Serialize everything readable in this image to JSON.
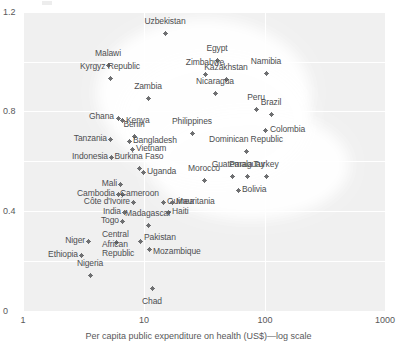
{
  "chart_data": {
    "type": "scatter",
    "title": "",
    "xlabel": "Per capita public expenditure on health (US$)—log scale",
    "ylabel": "",
    "xscale": "log",
    "xlim": [
      1,
      1000
    ],
    "ylim": [
      0,
      1.2
    ],
    "xticks": [
      "1",
      "10",
      "100",
      "1000"
    ],
    "xtick_values": [
      1,
      10,
      100,
      1000
    ],
    "yticks": [
      "0",
      "0.4",
      "0.8",
      "1.2"
    ],
    "ytick_values": [
      0,
      0.4,
      0.8,
      1.2
    ],
    "grid": true,
    "legend": "none",
    "points": [
      {
        "label": "Uzbekistan",
        "x": 15,
        "y": 1.155,
        "px": 165,
        "py": 33,
        "lx": 165,
        "ly": 26,
        "pos": "above"
      },
      {
        "label": "Egypt",
        "x": 45,
        "y": 1.06,
        "px": 217,
        "py": 60,
        "lx": 217,
        "ly": 53,
        "pos": "above"
      },
      {
        "label": "Namibia",
        "x": 100,
        "y": 1.025,
        "px": 266,
        "py": 73,
        "lx": 266,
        "ly": 66,
        "pos": "above"
      },
      {
        "label": "Malawi",
        "x": 6.5,
        "y": 1.06,
        "px": 108,
        "py": 65,
        "lx": 108,
        "ly": 58,
        "pos": "above"
      },
      {
        "label": "Zimbabwe",
        "x": 33,
        "y": 1.02,
        "px": 205,
        "py": 74,
        "lx": 205,
        "ly": 67,
        "pos": "above"
      },
      {
        "label": "Kazakhstan",
        "x": 48,
        "y": 1.01,
        "px": 226,
        "py": 79,
        "lx": 226,
        "ly": 72,
        "pos": "above"
      },
      {
        "label": "Kyrgyz Republic",
        "x": 6.8,
        "y": 1.01,
        "px": 110,
        "py": 78,
        "lx": 110,
        "ly": 71,
        "pos": "above"
      },
      {
        "label": "Nicaragua",
        "x": 42,
        "y": 0.955,
        "px": 215,
        "py": 93,
        "lx": 215,
        "ly": 86,
        "pos": "above"
      },
      {
        "label": "Zambia",
        "x": 14,
        "y": 0.925,
        "px": 148,
        "py": 98,
        "lx": 148,
        "ly": 91,
        "pos": "above"
      },
      {
        "label": "Peru",
        "x": 78,
        "y": 0.895,
        "px": 256,
        "py": 109,
        "lx": 256,
        "ly": 102,
        "pos": "above"
      },
      {
        "label": "Brazil",
        "x": 115,
        "y": 0.88,
        "px": 271,
        "py": 114,
        "lx": 271,
        "ly": 107,
        "pos": "above"
      },
      {
        "label": "Ghana",
        "x": 8.4,
        "y": 0.845,
        "px": 118,
        "py": 118,
        "lx": 114,
        "ly": 117,
        "pos": "left"
      },
      {
        "label": "Kenya",
        "x": 9.2,
        "y": 0.84,
        "px": 122,
        "py": 120,
        "lx": 126,
        "ly": 121,
        "pos": "right"
      },
      {
        "label": "Philippines",
        "x": 28,
        "y": 0.815,
        "px": 192,
        "py": 133,
        "lx": 192,
        "ly": 126,
        "pos": "above"
      },
      {
        "label": "Colombia",
        "x": 115,
        "y": 0.81,
        "px": 265,
        "py": 130,
        "lx": 270,
        "ly": 130,
        "pos": "right"
      },
      {
        "label": "Benin",
        "x": 10,
        "y": 0.8,
        "px": 134,
        "py": 136,
        "lx": 134,
        "ly": 129,
        "pos": "above"
      },
      {
        "label": "Tanzania",
        "x": 6.6,
        "y": 0.79,
        "px": 110,
        "py": 139,
        "lx": 107,
        "ly": 139,
        "pos": "left"
      },
      {
        "label": "Bangladesh",
        "x": 9.8,
        "y": 0.785,
        "px": 129,
        "py": 141,
        "lx": 133,
        "ly": 141,
        "pos": "right"
      },
      {
        "label": "Vietnam",
        "x": 10.4,
        "y": 0.765,
        "px": 132,
        "py": 149,
        "lx": 136,
        "ly": 149,
        "pos": "right"
      },
      {
        "label": "Dominican Republic",
        "x": 70,
        "y": 0.755,
        "px": 246,
        "py": 151,
        "lx": 246,
        "ly": 144,
        "pos": "above"
      },
      {
        "label": "Indonesia",
        "x": 6.6,
        "y": 0.74,
        "px": 111,
        "py": 157,
        "lx": 108,
        "ly": 157,
        "pos": "left"
      },
      {
        "label": "Burkina Faso",
        "x": 11,
        "y": 0.715,
        "px": 139,
        "py": 168,
        "lx": 139,
        "ly": 161,
        "pos": "above"
      },
      {
        "label": "Guatemala",
        "x": 56,
        "y": 0.695,
        "px": 232,
        "py": 176,
        "lx": 232,
        "ly": 169,
        "pos": "above"
      },
      {
        "label": "Paraguay",
        "x": 70,
        "y": 0.695,
        "px": 247,
        "py": 176,
        "lx": 247,
        "ly": 169,
        "pos": "above"
      },
      {
        "label": "Turkey",
        "x": 100,
        "y": 0.695,
        "px": 266,
        "py": 176,
        "lx": 266,
        "ly": 169,
        "pos": "above"
      },
      {
        "label": "Uganda",
        "x": 12,
        "y": 0.685,
        "px": 143,
        "py": 172,
        "lx": 147,
        "ly": 172,
        "pos": "right"
      },
      {
        "label": "Morocco",
        "x": 36,
        "y": 0.66,
        "px": 204,
        "py": 180,
        "lx": 204,
        "ly": 173,
        "pos": "above"
      },
      {
        "label": "Bolivia",
        "x": 62,
        "y": 0.64,
        "px": 238,
        "py": 190,
        "lx": 242,
        "ly": 190,
        "pos": "right"
      },
      {
        "label": "Mali",
        "x": 8.4,
        "y": 0.635,
        "px": 120,
        "py": 184,
        "lx": 117,
        "ly": 184,
        "pos": "left"
      },
      {
        "label": "Cambodia",
        "x": 8.0,
        "y": 0.6,
        "px": 118,
        "py": 194,
        "lx": 115,
        "ly": 194,
        "pos": "left"
      },
      {
        "label": "Cameroon",
        "x": 8.6,
        "y": 0.6,
        "px": 122,
        "py": 194,
        "lx": 120,
        "ly": 194,
        "pos": "right"
      },
      {
        "label": "Côte d'Ivoire",
        "x": 10,
        "y": 0.575,
        "px": 133,
        "py": 202,
        "lx": 130,
        "ly": 202,
        "pos": "left"
      },
      {
        "label": "Guinea",
        "x": 13,
        "y": 0.575,
        "px": 163,
        "py": 202,
        "lx": 167,
        "ly": 202,
        "pos": "right"
      },
      {
        "label": "Mauritania",
        "x": 17,
        "y": 0.575,
        "px": 172,
        "py": 202,
        "lx": 176,
        "ly": 202,
        "pos": "right"
      },
      {
        "label": "India",
        "x": 8.8,
        "y": 0.545,
        "px": 124,
        "py": 212,
        "lx": 121,
        "ly": 212,
        "pos": "left"
      },
      {
        "label": "Haiti",
        "x": 15,
        "y": 0.545,
        "px": 168,
        "py": 212,
        "lx": 172,
        "ly": 212,
        "pos": "right"
      },
      {
        "label": "Togo",
        "x": 8.4,
        "y": 0.515,
        "px": 122,
        "py": 221,
        "lx": 119,
        "ly": 221,
        "pos": "left"
      },
      {
        "label": "Madagascar",
        "x": 12,
        "y": 0.505,
        "px": 148,
        "py": 225,
        "lx": 148,
        "ly": 218,
        "pos": "above"
      },
      {
        "label": "Niger",
        "x": 4.4,
        "y": 0.455,
        "px": 88,
        "py": 241,
        "lx": 85,
        "ly": 241,
        "pos": "left"
      },
      {
        "label": "Pakistan",
        "x": 11,
        "y": 0.455,
        "px": 140,
        "py": 241,
        "lx": 144,
        "ly": 238,
        "pos": "right"
      },
      {
        "label": "Ethiopia",
        "x": 3.6,
        "y": 0.415,
        "px": 81,
        "py": 255,
        "lx": 78,
        "ly": 255,
        "pos": "left"
      },
      {
        "label": "Central\nAfrican\nRepublic",
        "x": 8.0,
        "y": 0.415,
        "px": 116,
        "py": 242,
        "lx": 102,
        "ly": 244,
        "pos": "right"
      },
      {
        "label": "Mozambique",
        "x": 14,
        "y": 0.43,
        "px": 149,
        "py": 249,
        "lx": 153,
        "ly": 252,
        "pos": "right"
      },
      {
        "label": "Nigeria",
        "x": 5.0,
        "y": 0.355,
        "px": 90,
        "py": 275,
        "lx": 90,
        "ly": 268,
        "pos": "above"
      },
      {
        "label": "Chad",
        "x": 13,
        "y": 0.325,
        "px": 152,
        "py": 288,
        "lx": 152,
        "ly": 297,
        "pos": "below"
      }
    ]
  },
  "axes": {
    "y_ticks": [
      {
        "text": "1.2",
        "py": 12
      },
      {
        "text": "0.8",
        "py": 111
      },
      {
        "text": "0.4",
        "py": 211
      },
      {
        "text": "0",
        "py": 311
      }
    ],
    "x_ticks": [
      {
        "text": "1",
        "px": 23
      },
      {
        "text": "10",
        "px": 144
      },
      {
        "text": "100",
        "px": 265
      },
      {
        "text": "1000",
        "px": 385
      }
    ],
    "x_title": "Per capita public expenditure on health (US$)—log scale"
  },
  "style": {
    "plot_bg": "#f0f0f0",
    "grid_color": "#ffffff",
    "marker_color": "#6f7072",
    "text_color": "#58585a",
    "highlight_color": "#ffffff"
  }
}
